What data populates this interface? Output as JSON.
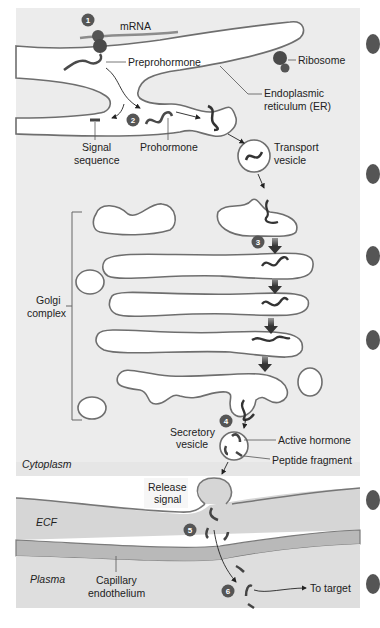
{
  "figure": {
    "colors": {
      "background_cytoplasm": "#ececec",
      "ecf": "#d9d9d9",
      "endothelium": "#b8b8b8",
      "plasma": "#dcdcdc",
      "membrane_stroke": "#6e6e6e",
      "organelle_fill": "#ffffff",
      "step_badge": "#555555",
      "hormone_chain": "#4a4a4a"
    },
    "steps": [
      {
        "number": "1"
      },
      {
        "number": "2"
      },
      {
        "number": "3"
      },
      {
        "number": "4"
      },
      {
        "number": "5"
      },
      {
        "number": "6"
      }
    ],
    "labels": {
      "mrna": "mRNA",
      "preprohormone": "Preprohormone",
      "ribosome": "Ribosome",
      "er_line1": "Endoplasmic",
      "er_line2": "reticulum (ER)",
      "signal_line1": "Signal",
      "signal_line2": "sequence",
      "prohormone": "Prohormone",
      "transport_line1": "Transport",
      "transport_line2": "vesicle",
      "golgi_line1": "Golgi",
      "golgi_line2": "complex",
      "secretory_line1": "Secretory",
      "secretory_line2": "vesicle",
      "active_hormone": "Active hormone",
      "peptide_fragment": "Peptide fragment",
      "cytoplasm": "Cytoplasm",
      "release_line1": "Release",
      "release_line2": "signal",
      "ecf": "ECF",
      "plasma": "Plasma",
      "capillary_line1": "Capillary",
      "capillary_line2": "endothelium",
      "to_target": "To target"
    }
  }
}
